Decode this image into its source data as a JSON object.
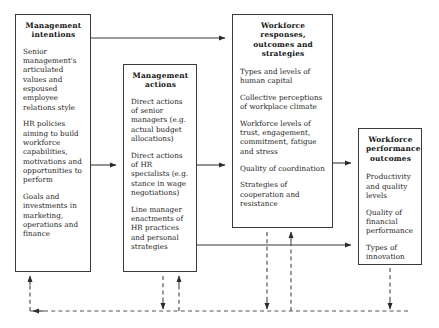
{
  "diagram": {
    "stroke_color": "#3a3a3a",
    "dashed_color": "#555555",
    "boxes": [
      {
        "id": "management-intentions",
        "title": "Management\nintentions",
        "title_lines": [
          "Management",
          "intentions"
        ],
        "items": [
          "Senior management's articulated values and espoused employee relations style",
          "HR policies aiming to build workforce capabilities, motivations and opportunities to perform",
          "Goals and investments in marketing, operations and finance"
        ]
      },
      {
        "id": "management-actions",
        "title": "Management actions",
        "title_lines": [
          "Management",
          "actions"
        ],
        "items": [
          "Direct actions of senior managers (e.g. actual budget allocations)",
          "Direct actions of HR specialists (e.g. stance in wage negotiations)",
          "Line manager enactments of HR practices and personal strategies"
        ]
      },
      {
        "id": "workforce-responses",
        "title": "Workforce responses, outcomes and strategies",
        "title_lines": [
          "Workforce responses,",
          "outcomes and strategies"
        ],
        "items": [
          "Types and levels of human capital",
          "Collective perceptions of workplace climate",
          "Workforce levels of trust, engagement, commitment, fatigue and stress",
          "Quality of coordination",
          "Strategies of cooperation and resistance"
        ]
      },
      {
        "id": "workforce-performance",
        "title": "Workforce performance outcomes",
        "title_lines": [
          "Workforce",
          "performance",
          "outcomes"
        ],
        "items": [
          "Productivity and quality levels",
          "Quality of financial performance",
          "Types of innovation"
        ]
      }
    ],
    "connectors": {
      "solid": [
        {
          "name": "intentions-to-responses-top",
          "from": "management-intentions",
          "to": "workforce-responses"
        },
        {
          "name": "intentions-to-actions",
          "from": "management-intentions",
          "to": "management-actions"
        },
        {
          "name": "actions-to-responses",
          "from": "management-actions",
          "to": "workforce-responses"
        },
        {
          "name": "responses-to-performance",
          "from": "workforce-responses",
          "to": "workforce-performance"
        },
        {
          "name": "actions-to-performance",
          "from": "management-actions",
          "to": "workforce-performance"
        }
      ],
      "dashed_feedback": [
        {
          "name": "feedback-to-intentions",
          "to": "management-intentions"
        },
        {
          "name": "feedback-to-actions",
          "to": "management-actions"
        },
        {
          "name": "feedback-from-actions",
          "from": "management-actions"
        },
        {
          "name": "feedback-to-responses",
          "to": "workforce-responses"
        },
        {
          "name": "feedback-from-responses",
          "from": "workforce-responses"
        },
        {
          "name": "feedback-from-performance",
          "from": "workforce-performance"
        }
      ]
    }
  }
}
